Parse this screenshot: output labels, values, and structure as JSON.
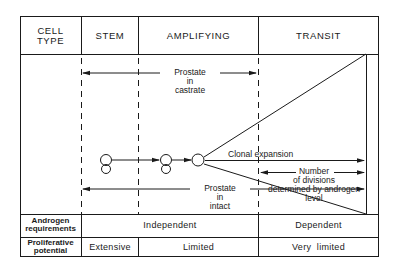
{
  "header": {
    "cell_type": "CELL TYPE",
    "cell_type_line1": "CELL",
    "cell_type_line2": "TYPE",
    "stem": "STEM",
    "amplifying": "AMPLIFYING",
    "transit": "TRANSIT"
  },
  "annotations": {
    "prostate_castrate": {
      "line1": "Prostate",
      "line2": "in",
      "line3": "castrate"
    },
    "prostate_intact": {
      "line1": "Prostate",
      "line2": "in",
      "line3": "intact"
    },
    "clonal_expansion": "Clonal expansion",
    "divisions": {
      "line1": "Number",
      "line2": "of divisions",
      "line3": "determined by androgen",
      "line4": "level"
    }
  },
  "rows": {
    "androgen": {
      "label_line1": "Androgen",
      "label_line2": "requirements",
      "independent": "Independent",
      "dependent": "Dependent"
    },
    "proliferative": {
      "label_line1": "Proliferative",
      "label_line2": "potential",
      "stem": "Extensive",
      "amplifying": "Limited",
      "transit": "Very  limited"
    }
  },
  "colors": {
    "line": "#1a1a1a",
    "background": "#ffffff"
  }
}
